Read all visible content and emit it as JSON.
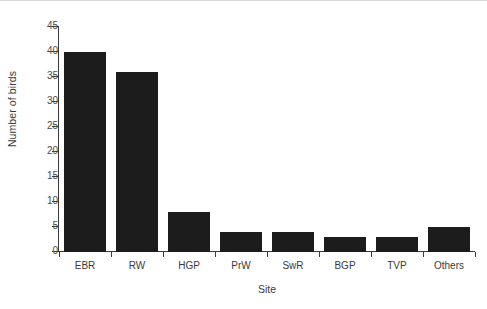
{
  "chart_data": {
    "type": "bar",
    "title": "",
    "subtitle": "",
    "xlabel": "Site",
    "ylabel": "Number of birds",
    "categories": [
      "EBR",
      "RW",
      "HGP",
      "PrW",
      "SwR",
      "BGP",
      "TVP",
      "Others"
    ],
    "values": [
      40,
      36,
      8,
      4,
      4,
      3,
      3,
      5
    ],
    "series": [
      {
        "name": "Number of birds",
        "values": [
          40,
          36,
          8,
          4,
          4,
          3,
          3,
          5
        ]
      }
    ],
    "ylim": [
      0,
      45
    ],
    "y_ticks": [
      0,
      5,
      10,
      15,
      20,
      25,
      30,
      35,
      40,
      45
    ],
    "y_tick_labels": [
      "0",
      "5",
      "10",
      "15",
      "20",
      "25",
      "30",
      "35",
      "40",
      "45"
    ],
    "grid": false,
    "legend": false,
    "legend_position": "none",
    "bar_color": "#1c1c1c",
    "axis_color": "#3a3a3a",
    "background_color": "#ffffff",
    "annotations": []
  }
}
